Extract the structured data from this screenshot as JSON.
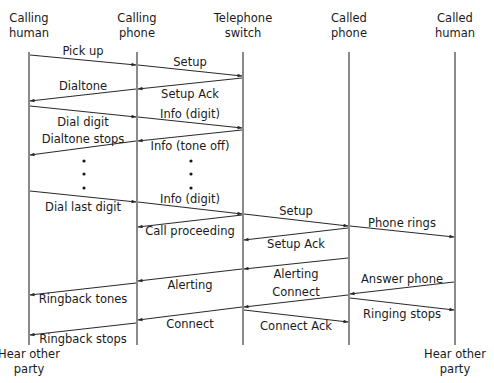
{
  "diagram": {
    "type": "sequence",
    "colors": {
      "line": "#2a2a2a",
      "text": "#1a1a1a",
      "background": "#ffffff"
    },
    "participants": [
      {
        "id": "calling_human",
        "label_line1": "Calling",
        "label_line2": "human",
        "x": 29,
        "end_label_line1": "Hear other",
        "end_label_line2": "party"
      },
      {
        "id": "calling_phone",
        "label_line1": "Calling",
        "label_line2": "phone",
        "x": 137
      },
      {
        "id": "switch",
        "label_line1": "Telephone",
        "label_line2": "switch",
        "x": 243
      },
      {
        "id": "called_phone",
        "label_line1": "Called",
        "label_line2": "phone",
        "x": 349
      },
      {
        "id": "called_human",
        "label_line1": "Called",
        "label_line2": "human",
        "x": 455,
        "end_label_line1": "Hear other",
        "end_label_line2": "party"
      }
    ],
    "messages": [
      {
        "label": "Pick up",
        "from": "calling_human",
        "to": "calling_phone",
        "y1": 55,
        "y2": 65,
        "label_pos": "above"
      },
      {
        "label": "Setup",
        "from": "calling_phone",
        "to": "switch",
        "y1": 65,
        "y2": 76,
        "label_pos": "above"
      },
      {
        "label": "Setup Ack",
        "from": "switch",
        "to": "calling_phone",
        "y1": 78,
        "y2": 89,
        "label_pos": "below"
      },
      {
        "label": "Dialtone",
        "from": "calling_phone",
        "to": "calling_human",
        "y1": 89,
        "y2": 101,
        "label_pos": "above"
      },
      {
        "label": "Dial digit",
        "from": "calling_human",
        "to": "calling_phone",
        "y1": 106,
        "y2": 117,
        "label_pos": "below"
      },
      {
        "label": "Info (digit)",
        "from": "calling_phone",
        "to": "switch",
        "y1": 117,
        "y2": 128,
        "label_pos": "above"
      },
      {
        "label": "Info (tone off)",
        "from": "switch",
        "to": "calling_phone",
        "y1": 130,
        "y2": 141,
        "label_pos": "below"
      },
      {
        "label": "Dialtone stops",
        "from": "calling_phone",
        "to": "calling_human",
        "y1": 141,
        "y2": 155,
        "label_pos": "above"
      },
      {
        "label": "Dial last digit",
        "from": "calling_human",
        "to": "calling_phone",
        "y1": 191,
        "y2": 202,
        "label_pos": "below"
      },
      {
        "label": "Info (digit)",
        "from": "calling_phone",
        "to": "switch",
        "y1": 202,
        "y2": 214,
        "label_pos": "above"
      },
      {
        "label": "Call proceeding",
        "from": "switch",
        "to": "calling_phone",
        "y1": 215,
        "y2": 227,
        "label_pos": "below"
      },
      {
        "label": "Setup",
        "from": "switch",
        "to": "called_phone",
        "y1": 214,
        "y2": 226,
        "label_pos": "above"
      },
      {
        "label": "Phone rings",
        "from": "called_phone",
        "to": "called_human",
        "y1": 226,
        "y2": 237,
        "label_pos": "above"
      },
      {
        "label": "Setup Ack",
        "from": "called_phone",
        "to": "switch",
        "y1": 228,
        "y2": 240,
        "label_pos": "below"
      },
      {
        "label": "Alerting",
        "from": "called_phone",
        "to": "switch",
        "y1": 258,
        "y2": 269,
        "label_pos": "below"
      },
      {
        "label": "Alerting",
        "from": "switch",
        "to": "calling_phone",
        "y1": 269,
        "y2": 281,
        "label_pos": "below"
      },
      {
        "label": "Ringback tones",
        "from": "calling_phone",
        "to": "calling_human",
        "y1": 283,
        "y2": 295,
        "label_pos": "below"
      },
      {
        "label": "Answer phone",
        "from": "called_human",
        "to": "called_phone",
        "y1": 282,
        "y2": 294,
        "label_pos": "above"
      },
      {
        "label": "Connect",
        "from": "called_phone",
        "to": "switch",
        "y1": 295,
        "y2": 307,
        "label_pos": "above"
      },
      {
        "label": "Ringing stops",
        "from": "called_phone",
        "to": "called_human",
        "y1": 298,
        "y2": 310,
        "label_pos": "below"
      },
      {
        "label": "Connect",
        "from": "switch",
        "to": "calling_phone",
        "y1": 307,
        "y2": 320,
        "label_pos": "below"
      },
      {
        "label": "Connect Ack",
        "from": "switch",
        "to": "called_phone",
        "y1": 310,
        "y2": 322,
        "label_pos": "below"
      },
      {
        "label": "Ringback stops",
        "from": "calling_phone",
        "to": "calling_human",
        "y1": 323,
        "y2": 335,
        "label_pos": "below"
      }
    ],
    "ellipsis_dots": [
      {
        "x": 84,
        "ys": [
          161,
          174,
          188
        ]
      },
      {
        "x": 191,
        "ys": [
          161,
          174,
          188
        ]
      }
    ],
    "lifeline_top": 52,
    "lifeline_bottom": 345
  }
}
